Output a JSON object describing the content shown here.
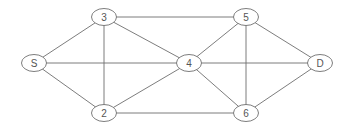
{
  "diagram": {
    "type": "undirected-graph",
    "colors": {
      "stroke": "#6e6e6e",
      "label": "#555555",
      "fill": "#ffffff"
    },
    "nodes": [
      {
        "id": "S",
        "label": "S",
        "x": 34,
        "y": 63
      },
      {
        "id": "3",
        "label": "3",
        "x": 104,
        "y": 17
      },
      {
        "id": "2",
        "label": "2",
        "x": 104,
        "y": 113
      },
      {
        "id": "4",
        "label": "4",
        "x": 189,
        "y": 63
      },
      {
        "id": "5",
        "label": "5",
        "x": 246,
        "y": 17
      },
      {
        "id": "6",
        "label": "6",
        "x": 246,
        "y": 113
      },
      {
        "id": "D",
        "label": "D",
        "x": 320,
        "y": 63
      }
    ],
    "edges": [
      [
        "S",
        "3"
      ],
      [
        "S",
        "2"
      ],
      [
        "S",
        "4"
      ],
      [
        "3",
        "2"
      ],
      [
        "3",
        "4"
      ],
      [
        "3",
        "5"
      ],
      [
        "2",
        "4"
      ],
      [
        "2",
        "6"
      ],
      [
        "4",
        "5"
      ],
      [
        "4",
        "6"
      ],
      [
        "4",
        "D"
      ],
      [
        "5",
        "6"
      ],
      [
        "5",
        "D"
      ],
      [
        "6",
        "D"
      ]
    ]
  }
}
